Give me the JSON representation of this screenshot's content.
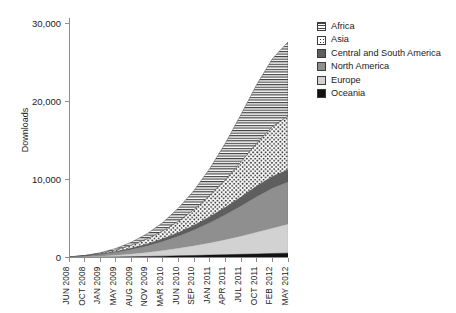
{
  "chart_data": {
    "type": "area",
    "title": "",
    "xlabel": "",
    "ylabel": "Downloads",
    "ylim": [
      0,
      30000
    ],
    "yticks": [
      "0",
      "10,000",
      "20,000",
      "30,000"
    ],
    "ytick_values": [
      0,
      10000,
      20000,
      30000
    ],
    "grid": false,
    "stacked": true,
    "legend_position": "top-right",
    "categories": [
      "JUN 2008",
      "OCT 2008",
      "JAN 2009",
      "MAY 2009",
      "AUG 2009",
      "NOV 2009",
      "MAR 2010",
      "JUN 2010",
      "SEP 2010",
      "JAN 2011",
      "APR 2011",
      "JUL 2011",
      "OCT 2011",
      "FEB 2012",
      "MAY 2012"
    ],
    "series": [
      {
        "name": "Oceania",
        "color": "#111111",
        "pattern": "solid",
        "values": [
          10,
          25,
          45,
          70,
          100,
          135,
          175,
          215,
          260,
          310,
          360,
          410,
          460,
          510,
          560
        ]
      },
      {
        "name": "Europe",
        "color": "#d2d2d2",
        "pattern": "solid",
        "values": [
          20,
          60,
          130,
          230,
          360,
          520,
          720,
          960,
          1240,
          1560,
          1920,
          2320,
          2760,
          3240,
          3700
        ]
      },
      {
        "name": "North America",
        "color": "#8f8f8f",
        "pattern": "solid",
        "values": [
          30,
          90,
          200,
          360,
          570,
          830,
          1160,
          1560,
          2030,
          2570,
          3180,
          3860,
          4560,
          5120,
          5400
        ]
      },
      {
        "name": "Central and South America",
        "color": "#5e5e5e",
        "pattern": "solid",
        "values": [
          5,
          20,
          45,
          85,
          140,
          215,
          310,
          430,
          570,
          740,
          930,
          1140,
          1340,
          1480,
          1540
        ]
      },
      {
        "name": "Asia",
        "color": "#ffffff",
        "pattern": "dotted",
        "values": [
          10,
          40,
          110,
          230,
          420,
          680,
          1030,
          1480,
          2040,
          2740,
          3560,
          4500,
          5520,
          6400,
          6900
        ]
      },
      {
        "name": "Africa",
        "color": "#ffffff",
        "pattern": "horizontal-lines",
        "values": [
          5,
          25,
          80,
          190,
          380,
          670,
          1090,
          1680,
          2470,
          3480,
          4700,
          6100,
          7500,
          8700,
          9500
        ]
      }
    ],
    "totals": [
      80,
      260,
      610,
      1165,
      1970,
      3050,
      4485,
      6325,
      8610,
      11400,
      14650,
      18330,
      22140,
      25450,
      27600
    ]
  },
  "legend": {
    "items": [
      {
        "label": "Africa",
        "swatch": "africa-swatch"
      },
      {
        "label": "Asia",
        "swatch": "asia-swatch"
      },
      {
        "label": "Central and South America",
        "swatch": "central-south-america-swatch"
      },
      {
        "label": "North America",
        "swatch": "north-america-swatch"
      },
      {
        "label": "Europe",
        "swatch": "europe-swatch"
      },
      {
        "label": "Oceania",
        "swatch": "oceania-swatch"
      }
    ]
  }
}
